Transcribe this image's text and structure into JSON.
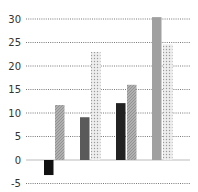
{
  "chart_data": {
    "type": "bar",
    "title": "",
    "xlabel": "",
    "ylabel": "",
    "ylim": [
      -5,
      30
    ],
    "yticks": [
      -5,
      0,
      5,
      10,
      15,
      20,
      25,
      30
    ],
    "grid": true,
    "legend": "none",
    "categories": [
      "",
      "",
      "",
      ""
    ],
    "bars": [
      {
        "group": 0,
        "value": -3.2,
        "style": "solid-black",
        "color": "#111111"
      },
      {
        "group": 0,
        "value": 11.7,
        "style": "hatched-grey",
        "color": "#9a9a9a"
      },
      {
        "group": 1,
        "value": 9.1,
        "style": "solid-dark-grey",
        "color": "#5a5a5a"
      },
      {
        "group": 1,
        "value": 23.0,
        "style": "dotted-light",
        "color": "#d8d8d8"
      },
      {
        "group": 2,
        "value": 12.1,
        "style": "solid-black",
        "color": "#222222"
      },
      {
        "group": 2,
        "value": 16.0,
        "style": "hatched-grey",
        "color": "#a8a8a8"
      },
      {
        "group": 3,
        "value": 30.4,
        "style": "solid-grey",
        "color": "#a0a0a0"
      },
      {
        "group": 3,
        "value": 24.6,
        "style": "dotted-light",
        "color": "#d8d8d8"
      }
    ]
  }
}
